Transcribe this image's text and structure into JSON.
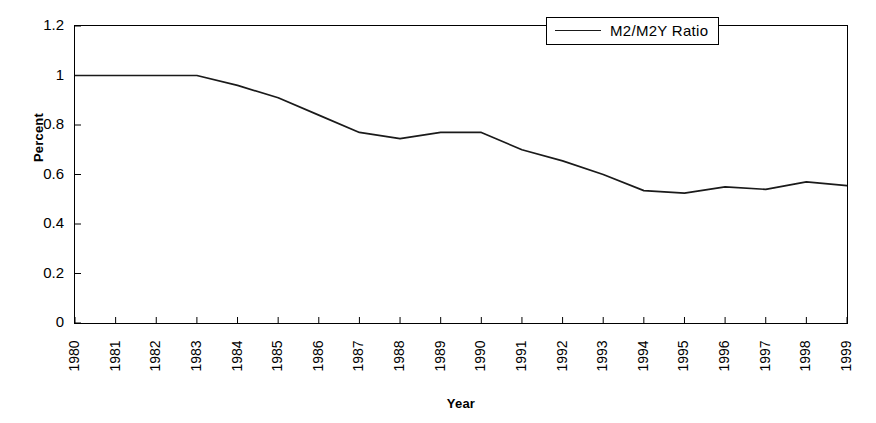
{
  "chart_data": {
    "type": "line",
    "title": "",
    "subtitle": "",
    "xlabel": "Year",
    "ylabel": "Percent",
    "categories": [
      "1980",
      "1981",
      "1982",
      "1983",
      "1984",
      "1985",
      "1986",
      "1987",
      "1988",
      "1989",
      "1990",
      "1991",
      "1992",
      "1993",
      "1994",
      "1995",
      "1996",
      "1997",
      "1998",
      "1999"
    ],
    "x": [
      1980,
      1981,
      1982,
      1983,
      1984,
      1985,
      1986,
      1987,
      1988,
      1989,
      1990,
      1991,
      1992,
      1993,
      1994,
      1995,
      1996,
      1997,
      1998,
      1999
    ],
    "series": [
      {
        "name": "M2/M2Y Ratio",
        "color": "#1a1a1a",
        "values": [
          1.0,
          1.0,
          1.0,
          1.0,
          0.96,
          0.91,
          0.84,
          0.77,
          0.745,
          0.77,
          0.77,
          0.7,
          0.655,
          0.6,
          0.535,
          0.525,
          0.55,
          0.54,
          0.57,
          0.555
        ]
      }
    ],
    "ylim": [
      0,
      1.2
    ],
    "yticks": [
      "0",
      "0.2",
      "0.4",
      "0.6",
      "0.8",
      "1",
      "1.2"
    ],
    "ytick_values": [
      0,
      0.2,
      0.4,
      0.6,
      0.8,
      1,
      1.2
    ],
    "xlim": [
      1980,
      1999
    ],
    "grid": false,
    "legend": {
      "position": "top-right",
      "entries": [
        {
          "label": "M2/M2Y Ratio",
          "marker": "line-sample",
          "color": "#1a1a1a"
        }
      ]
    },
    "axis_color": "#000000",
    "background": "#ffffff"
  }
}
